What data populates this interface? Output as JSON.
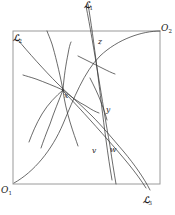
{
  "figure": {
    "kind": "geometric-diagram",
    "background_color": "#ffffff",
    "stroke_color": "#3a3a3a",
    "frame_color": "#9a9a9a",
    "frame": {
      "x": 13,
      "y": 31,
      "width": 147,
      "height": 153
    },
    "corner_labels": [
      {
        "id": "O1",
        "base": "O",
        "sub": "1",
        "x": 1,
        "y": 186
      },
      {
        "id": "O2",
        "base": "O",
        "sub": "2",
        "x": 161,
        "y": 24
      }
    ],
    "line_labels": [
      {
        "id": "L1",
        "base": "ℒ",
        "sub": "1",
        "x": 84,
        "y": 1
      },
      {
        "id": "L2",
        "base": "ℒ",
        "sub": "2",
        "x": 13,
        "y": 34
      },
      {
        "id": "L3",
        "base": "ℒ",
        "sub": "3",
        "x": 143,
        "y": 196
      }
    ],
    "point_labels": [
      {
        "id": "x",
        "text": "x",
        "x": 64,
        "y": 92
      },
      {
        "id": "z",
        "text": "z",
        "x": 98,
        "y": 38
      },
      {
        "id": "y",
        "text": "y",
        "x": 106,
        "y": 106
      },
      {
        "id": "v",
        "text": "v",
        "x": 92,
        "y": 147
      },
      {
        "id": "w",
        "text": "w",
        "x": 110,
        "y": 146
      }
    ]
  }
}
